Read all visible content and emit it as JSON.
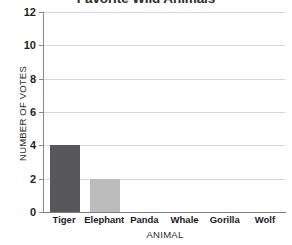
{
  "chart_data": {
    "type": "bar",
    "title": "Favorite Wild Animals",
    "xlabel": "ANIMAL",
    "ylabel": "NUMBER OF VOTES",
    "categories": [
      "Tiger",
      "Elephant",
      "Panda",
      "Whale",
      "Gorilla",
      "Wolf"
    ],
    "values": [
      4,
      2,
      0,
      0,
      0,
      0
    ],
    "bar_colors": [
      "#58585a",
      "#bcbcbc",
      "#bcbcbc",
      "#bcbcbc",
      "#bcbcbc",
      "#bcbcbc"
    ],
    "ylim": [
      0,
      12
    ],
    "ytick_labels": [
      "0",
      "2",
      "4",
      "6",
      "8",
      "10",
      "12"
    ],
    "ytick_values": [
      0,
      2,
      4,
      6,
      8,
      10,
      12
    ],
    "grid": true,
    "legend": false,
    "axis_color": "#8a8a8a",
    "grid_color": "#d7d7d7",
    "text_color": "#1f1f1f",
    "background": "#ffffff"
  }
}
